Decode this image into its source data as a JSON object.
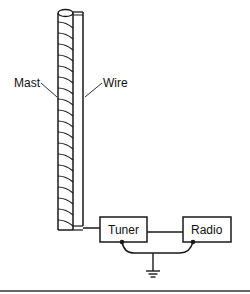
{
  "diagram": {
    "type": "antenna-wiring-schematic",
    "labels": {
      "mast": "Mast",
      "wire": "Wire",
      "tuner": "Tuner",
      "radio": "Radio"
    },
    "components": [
      {
        "id": "mast",
        "label": "Mast",
        "kind": "coiled vertical mast"
      },
      {
        "id": "wire",
        "label": "Wire",
        "kind": "vertical antenna wire"
      },
      {
        "id": "tuner",
        "label": "Tuner",
        "kind": "box"
      },
      {
        "id": "radio",
        "label": "Radio",
        "kind": "box"
      },
      {
        "id": "ground",
        "label": "",
        "kind": "ground symbol"
      }
    ],
    "connections": [
      {
        "from": "wire",
        "to": "tuner"
      },
      {
        "from": "tuner",
        "to": "radio"
      },
      {
        "from": "tuner",
        "to": "ground"
      },
      {
        "from": "radio",
        "to": "ground"
      }
    ],
    "colors": {
      "line": "#1a1a1a",
      "background": "#ffffff"
    }
  }
}
